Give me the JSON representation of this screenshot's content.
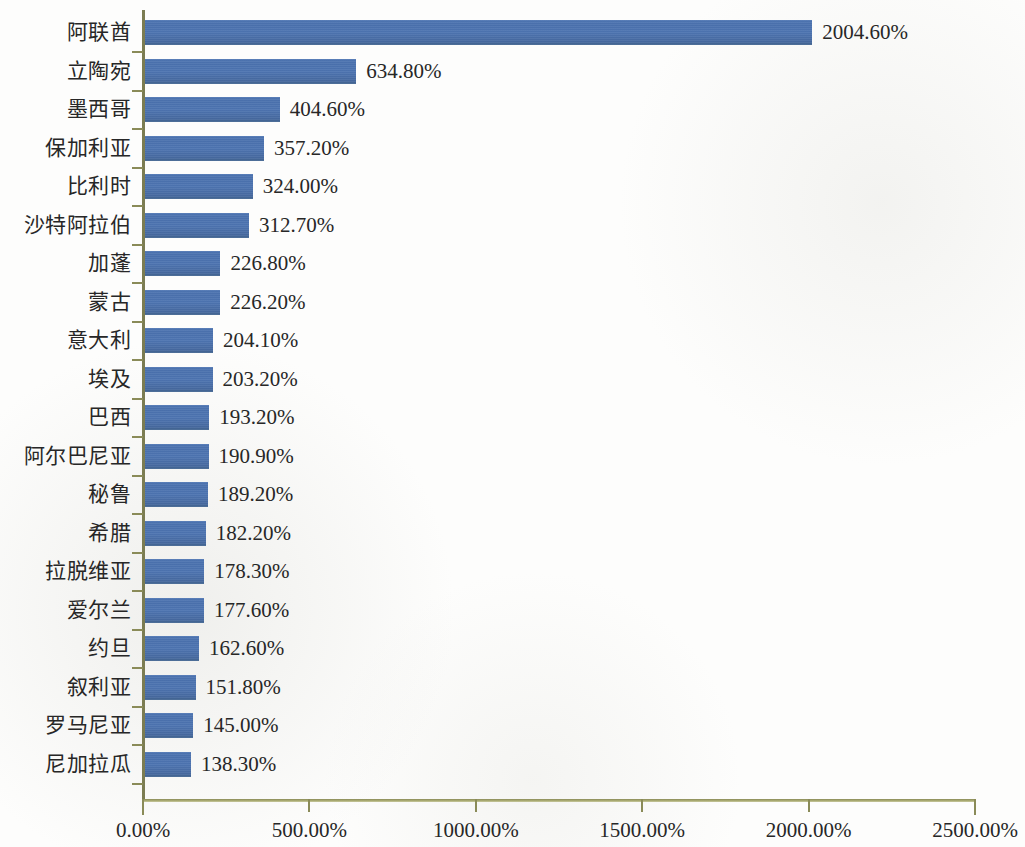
{
  "chart_data": {
    "type": "bar",
    "orientation": "horizontal",
    "title": "",
    "subtitle": "",
    "xlabel": "",
    "ylabel": "",
    "xlim": [
      0,
      2500
    ],
    "grid": false,
    "legend": null,
    "value_suffix": "%",
    "bar_color": "#4a71ae",
    "axis_color": "#8a8b58",
    "text_color": "#272727",
    "background_color": "#fdfdfc",
    "x_ticks": [
      0,
      500,
      1000,
      1500,
      2000,
      2500
    ],
    "x_tick_labels": [
      "0.00%",
      "500.00%",
      "1000.00%",
      "1500.00%",
      "2000.00%",
      "2500.00%"
    ],
    "categories": [
      "阿联酋",
      "立陶宛",
      "墨西哥",
      "保加利亚",
      "比利时",
      "沙特阿拉伯",
      "加蓬",
      "蒙古",
      "意大利",
      "埃及",
      "巴西",
      "阿尔巴尼亚",
      "秘鲁",
      "希腊",
      "拉脱维亚",
      "爱尔兰",
      "约旦",
      "叙利亚",
      "罗马尼亚",
      "尼加拉瓜"
    ],
    "values": [
      2004.6,
      634.8,
      404.6,
      357.2,
      324.0,
      312.7,
      226.8,
      226.2,
      204.1,
      203.2,
      193.2,
      190.9,
      189.2,
      182.2,
      178.3,
      177.6,
      162.6,
      151.8,
      145.0,
      138.3
    ],
    "value_labels": [
      "2004.60%",
      "634.80%",
      "404.60%",
      "357.20%",
      "324.00%",
      "312.70%",
      "226.80%",
      "226.20%",
      "204.10%",
      "203.20%",
      "193.20%",
      "190.90%",
      "189.20%",
      "182.20%",
      "178.30%",
      "177.60%",
      "162.60%",
      "151.80%",
      "145.00%",
      "138.30%"
    ]
  }
}
